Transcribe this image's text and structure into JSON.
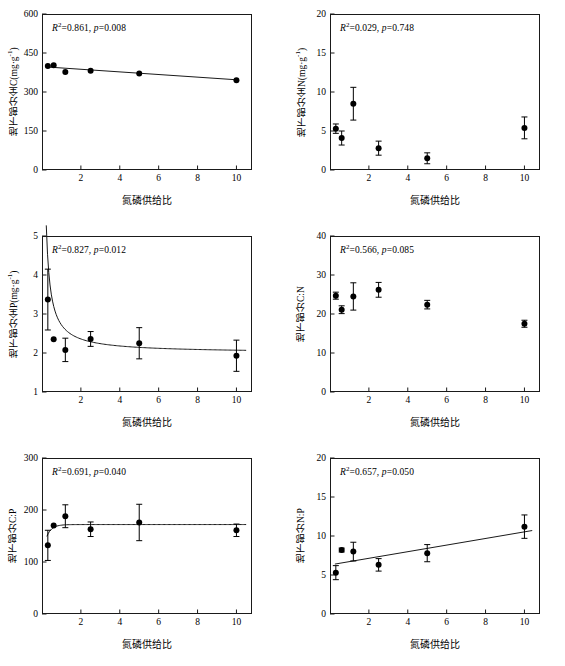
{
  "figure": {
    "shared_xlabel": "氮磷供给比",
    "x_ticks": [
      "2",
      "4",
      "6",
      "8",
      "10"
    ],
    "x_tick_values": [
      2,
      4,
      6,
      8,
      10
    ],
    "xlim": [
      0,
      10.8
    ],
    "marker_color": "#000000",
    "line_color": "#1a1a1a",
    "axis_color": "#1a1a1a"
  },
  "chart_data": [
    {
      "id": "panel-c",
      "type": "scatter",
      "title": "",
      "xlabel": "氮磷供给比",
      "ylabel": "地下部分全C(mg·g⁻¹)",
      "ylabel_plain": "地下部分全C",
      "ylabel_unit": "mg·g-1",
      "xlim": [
        0,
        10.8
      ],
      "ylim": [
        0,
        600
      ],
      "y_ticks": [
        "0",
        "150",
        "300",
        "450",
        "600"
      ],
      "y_tick_values": [
        0,
        150,
        300,
        450,
        600
      ],
      "grid": false,
      "annotation": {
        "r2_label": "R",
        "r2_value": "0.861",
        "p_label": "p",
        "p_value": "0.008",
        "text": "R²=0.861, p=0.008"
      },
      "x": [
        0.3,
        0.6,
        1.2,
        2.5,
        5.0,
        10.0
      ],
      "values": [
        400,
        403,
        377,
        382,
        371,
        345
      ],
      "errors": [
        0,
        0,
        0,
        0,
        0,
        0
      ],
      "fit": {
        "type": "linear",
        "points_x": [
          0.3,
          10.0
        ],
        "points_y": [
          396,
          347
        ]
      }
    },
    {
      "id": "panel-n",
      "type": "scatter",
      "xlabel": "氮磷供给比",
      "ylabel": "地下部分全N(mg·g⁻¹)",
      "ylabel_plain": "地下部分全N",
      "ylabel_unit": "mg·g-1",
      "xlim": [
        0,
        10.8
      ],
      "ylim": [
        0,
        20
      ],
      "y_ticks": [
        "0",
        "5",
        "10",
        "15",
        "20"
      ],
      "y_tick_values": [
        0,
        5,
        10,
        15,
        20
      ],
      "grid": false,
      "annotation": {
        "r2_label": "R",
        "r2_value": "0.029",
        "p_label": "p",
        "p_value": "0.748",
        "text": "R²=0.029, p=0.748"
      },
      "x": [
        0.3,
        0.6,
        1.2,
        2.5,
        5.0,
        10.0
      ],
      "values": [
        5.3,
        4.1,
        8.5,
        2.8,
        1.5,
        5.4
      ],
      "errors": [
        0.6,
        0.9,
        2.1,
        0.9,
        0.7,
        1.4
      ],
      "fit": null
    },
    {
      "id": "panel-p",
      "type": "scatter",
      "xlabel": "氮磷供给比",
      "ylabel": "地下部分全P(mg·g⁻¹)",
      "ylabel_plain": "地下部分全P",
      "ylabel_unit": "mg·g-1",
      "xlim": [
        0,
        10.8
      ],
      "ylim": [
        1,
        5
      ],
      "y_ticks": [
        "1",
        "2",
        "3",
        "4",
        "5"
      ],
      "y_tick_values": [
        1,
        2,
        3,
        4,
        5
      ],
      "grid": false,
      "annotation": {
        "r2_label": "R",
        "r2_value": "0.827",
        "p_label": "p",
        "p_value": "0.012",
        "text": "R²=0.827, p=0.012"
      },
      "x": [
        0.3,
        0.6,
        1.2,
        2.5,
        5.0,
        10.0
      ],
      "values": [
        3.37,
        2.35,
        2.08,
        2.36,
        2.25,
        1.93
      ],
      "errors": [
        0.78,
        0.0,
        0.3,
        0.19,
        0.4,
        0.4
      ],
      "fit": {
        "type": "power-decay",
        "asymptote": 2.0,
        "amplitude": 0.72,
        "decay": 3.2,
        "x_start": 0.22,
        "x_end": 10.5
      }
    },
    {
      "id": "panel-cn",
      "type": "scatter",
      "xlabel": "氮磷供给比",
      "ylabel": "地下部分C:N",
      "ylabel_plain": "地下部分C:N",
      "ylabel_unit": "",
      "xlim": [
        0,
        10.8
      ],
      "ylim": [
        0,
        40
      ],
      "y_ticks": [
        "0",
        "10",
        "20",
        "30",
        "40"
      ],
      "y_tick_values": [
        0,
        10,
        20,
        30,
        40
      ],
      "grid": false,
      "annotation": {
        "r2_label": "R",
        "r2_value": "0.566",
        "p_label": "p",
        "p_value": "0.085",
        "text": "R²=0.566, p=0.085"
      },
      "x": [
        0.3,
        0.6,
        1.2,
        2.5,
        5.0,
        10.0
      ],
      "values": [
        24.7,
        21.1,
        24.5,
        26.2,
        22.4,
        17.5
      ],
      "errors": [
        0.9,
        1.0,
        3.5,
        1.9,
        1.1,
        0.9
      ],
      "fit": null
    },
    {
      "id": "panel-cp",
      "type": "scatter",
      "xlabel": "氮磷供给比",
      "ylabel": "地下部分C:P",
      "ylabel_plain": "地下部分C:P",
      "ylabel_unit": "",
      "xlim": [
        0,
        10.8
      ],
      "ylim": [
        0,
        300
      ],
      "y_ticks": [
        "0",
        "100",
        "200",
        "300"
      ],
      "y_tick_values": [
        0,
        100,
        200,
        300
      ],
      "grid": false,
      "annotation": {
        "r2_label": "R",
        "r2_value": "0.691",
        "p_label": "p",
        "p_value": "0.040",
        "text": "R²=0.691, p=0.040"
      },
      "x": [
        0.3,
        0.6,
        1.2,
        2.5,
        5.0,
        10.0
      ],
      "values": [
        132,
        170,
        188,
        163,
        176,
        161
      ],
      "errors": [
        29,
        0,
        22,
        14,
        35,
        12
      ],
      "fit": {
        "type": "rise-plateau",
        "asymptote": 172,
        "amplitude": 62,
        "decay": 4.0,
        "x_start": 0.25,
        "x_end": 10.5
      }
    },
    {
      "id": "panel-np",
      "type": "scatter",
      "xlabel": "氮磷供给比",
      "ylabel": "地下部分N:P",
      "ylabel_plain": "地下部分N:P",
      "ylabel_unit": "",
      "xlim": [
        0,
        10.8
      ],
      "ylim": [
        0,
        20
      ],
      "y_ticks": [
        "0",
        "5",
        "10",
        "15",
        "20"
      ],
      "y_tick_values": [
        0,
        5,
        10,
        15,
        20
      ],
      "grid": false,
      "annotation": {
        "r2_label": "R",
        "r2_value": "0.657",
        "p_label": "p",
        "p_value": "0.050",
        "text": "R²=0.657, p=0.050"
      },
      "x": [
        0.3,
        0.6,
        1.2,
        2.5,
        5.0,
        10.0
      ],
      "values": [
        5.3,
        8.2,
        8.0,
        6.3,
        7.8,
        11.2
      ],
      "errors": [
        0.9,
        0.25,
        1.2,
        0.8,
        1.1,
        1.5
      ],
      "fit": {
        "type": "linear",
        "points_x": [
          0.25,
          10.4
        ],
        "points_y": [
          6.4,
          10.7
        ]
      }
    }
  ]
}
